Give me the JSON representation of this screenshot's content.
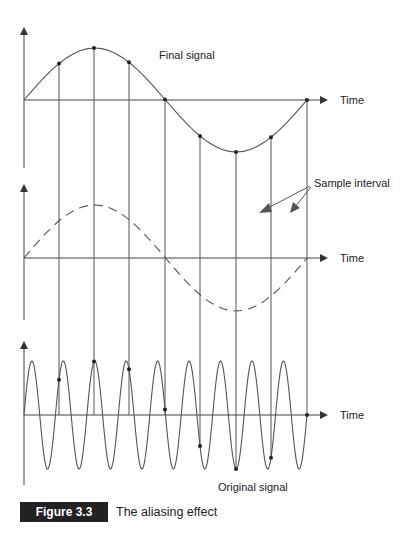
{
  "figure": {
    "number_label": "Figure 3.3",
    "title": "The aliasing effect"
  },
  "labels": {
    "final_signal": "Final signal",
    "sample_interval": "Sample interval",
    "original_signal": "Original signal",
    "time_top": "Time",
    "time_middle": "Time",
    "time_bottom": "Time"
  },
  "colors": {
    "line": "#555555",
    "axis": "#444444",
    "dot": "#222222",
    "caption_box": "#222222"
  },
  "layout": {
    "x_start": 24,
    "x_end": 307,
    "sample_x": [
      59,
      94,
      129,
      165,
      200,
      236,
      271,
      307
    ],
    "panels": [
      {
        "name": "final",
        "axis_y": 100,
        "amp": 52,
        "cycles": 1,
        "dashed": false,
        "axis_top": 25,
        "axis_bottom": 168
      },
      {
        "name": "sample",
        "axis_y": 258,
        "amp": 53,
        "cycles": 1,
        "dashed": true,
        "axis_top": 182,
        "axis_bottom": 320
      },
      {
        "name": "original",
        "axis_y": 415,
        "amp": 54,
        "cycles": 9,
        "dashed": false,
        "axis_top": 339,
        "axis_bottom": 485
      }
    ]
  },
  "chart_data": {
    "type": "line",
    "title": "The aliasing effect",
    "xlabel": "Time",
    "series": [
      {
        "name": "Original signal",
        "cycles_in_window": 9
      },
      {
        "name": "Sample interval (dashed)",
        "cycles_in_window": 1
      },
      {
        "name": "Final signal (aliased)",
        "cycles_in_window": 1
      }
    ],
    "samples_per_window": 8
  }
}
